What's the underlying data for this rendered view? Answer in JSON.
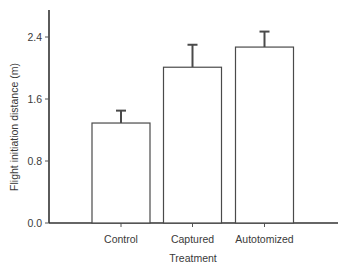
{
  "chart_data": {
    "type": "bar",
    "title": "",
    "xlabel": "Treatment",
    "ylabel": "Flight initiation distance (m)",
    "categories": [
      "Control",
      "Captured",
      "Autotomized"
    ],
    "values": [
      1.29,
      2.01,
      2.27
    ],
    "error_upper": [
      1.45,
      2.3,
      2.47
    ],
    "error_bars": [
      0.16,
      0.29,
      0.2
    ],
    "ylim": [
      0,
      2.75
    ],
    "yticks": [
      0.0,
      0.8,
      1.6,
      2.4
    ],
    "ytick_labels": [
      "0.0",
      "0.8",
      "1.6",
      "2.4"
    ],
    "grid": false,
    "legend": null,
    "bar_fill": "#ffffff",
    "bar_stroke": "#4a4a4a"
  },
  "axes": {
    "xlabel": "Treatment",
    "ylabel": "Flight initiation distance (m)"
  }
}
